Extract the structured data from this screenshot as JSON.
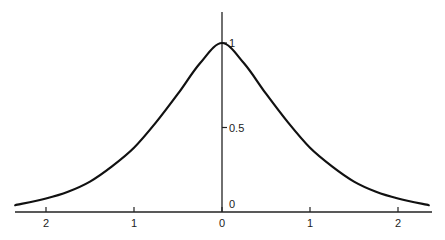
{
  "chart_data": {
    "type": "line",
    "title": "",
    "xlabel": "",
    "ylabel": "",
    "x_tick_labels": [
      "2",
      "1",
      "0",
      "1",
      "2"
    ],
    "x_tick_values": [
      -2,
      -1,
      0,
      1,
      2
    ],
    "y_tick_labels": [
      "0",
      "0.5",
      "1"
    ],
    "y_tick_values": [
      0,
      0.5,
      1
    ],
    "xlim": [
      -2.35,
      2.4
    ],
    "ylim": [
      0,
      1.18
    ],
    "grid": false,
    "legend": null,
    "series": [
      {
        "name": "bell curve (symmetric peak at 0)",
        "x": [
          -2.35,
          -2.0,
          -1.75,
          -1.5,
          -1.25,
          -1.0,
          -0.75,
          -0.5,
          -0.25,
          0.0,
          0.25,
          0.5,
          0.75,
          1.0,
          1.25,
          1.5,
          1.75,
          2.0,
          2.35
        ],
        "y": [
          0.04,
          0.08,
          0.12,
          0.18,
          0.27,
          0.38,
          0.53,
          0.7,
          0.88,
          1.0,
          0.88,
          0.7,
          0.53,
          0.38,
          0.27,
          0.18,
          0.12,
          0.08,
          0.04
        ]
      }
    ],
    "note": "Curve values estimated from the drawing; underlying function not labeled in the image."
  }
}
